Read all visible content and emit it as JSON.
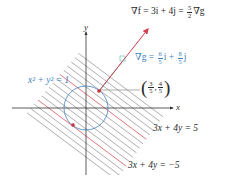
{
  "colors": {
    "level_line": "#8a8a8a",
    "level_line_highlight": "#d0505a",
    "circle": "#3f7fc0",
    "grad_f_arrow": "#d43d4a",
    "grad_g_arrow": "#5bb5a5",
    "axis": "#333333",
    "point": "#c8303a",
    "text_blue": "#3f7fc0",
    "text_dark": "#2a2a2a"
  },
  "axes": {
    "x_label": "x",
    "y_label": "y",
    "origin_px": [
      86,
      108
    ]
  },
  "circle": {
    "equation": "x² + y² = 1",
    "radius_px": 22
  },
  "level_lines": {
    "family": "3x + 4y = c",
    "labels": {
      "upper": "3x + 4y = 5",
      "lower": "3x + 4y = −5"
    }
  },
  "gradient_f": {
    "label_prefix": "∇f = 3i + 4j = ",
    "frac_num": "5",
    "frac_den": "2",
    "label_suffix": "∇g"
  },
  "gradient_g": {
    "label_prefix": "∇g = ",
    "frac1_num": "6",
    "frac1_den": "5",
    "mid": "i + ",
    "frac2_num": "8",
    "frac2_den": "5",
    "label_suffix": "j"
  },
  "max_point": {
    "label_x_num": "3",
    "label_x_den": "5",
    "label_y_num": "4",
    "label_y_den": "5"
  }
}
